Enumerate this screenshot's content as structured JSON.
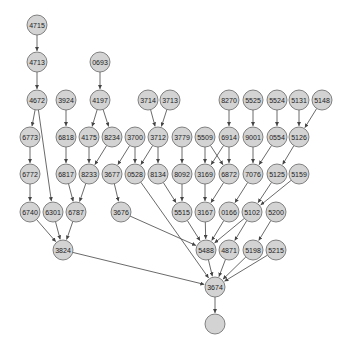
{
  "diagram": {
    "type": "directed-graph",
    "node_radius": 10,
    "node_fill": "#d3d3d3",
    "node_stroke": "#666666",
    "edge_color": "#444444",
    "nodes": [
      {
        "id": "4715",
        "label": "4715",
        "x": 37,
        "y": 25
      },
      {
        "id": "4713",
        "label": "4713",
        "x": 37,
        "y": 62
      },
      {
        "id": "0693",
        "label": "0693",
        "x": 100,
        "y": 62
      },
      {
        "id": "4672",
        "label": "4672",
        "x": 37,
        "y": 100
      },
      {
        "id": "3924",
        "label": "3924",
        "x": 66,
        "y": 100
      },
      {
        "id": "4197",
        "label": "4197",
        "x": 100,
        "y": 100
      },
      {
        "id": "3714",
        "label": "3714",
        "x": 148,
        "y": 100
      },
      {
        "id": "3713",
        "label": "3713",
        "x": 170,
        "y": 100
      },
      {
        "id": "8270",
        "label": "8270",
        "x": 229,
        "y": 100
      },
      {
        "id": "5525",
        "label": "5525",
        "x": 253,
        "y": 100
      },
      {
        "id": "5524",
        "label": "5524",
        "x": 277,
        "y": 100
      },
      {
        "id": "5131",
        "label": "5131",
        "x": 299,
        "y": 100
      },
      {
        "id": "5148",
        "label": "5148",
        "x": 322,
        "y": 100
      },
      {
        "id": "6773",
        "label": "6773",
        "x": 30,
        "y": 137
      },
      {
        "id": "6818",
        "label": "6818",
        "x": 66,
        "y": 137
      },
      {
        "id": "4175",
        "label": "4175",
        "x": 89,
        "y": 137
      },
      {
        "id": "8234",
        "label": "8234",
        "x": 112,
        "y": 137
      },
      {
        "id": "3700",
        "label": "3700",
        "x": 135,
        "y": 137
      },
      {
        "id": "3712",
        "label": "3712",
        "x": 158,
        "y": 137
      },
      {
        "id": "3779",
        "label": "3779",
        "x": 182,
        "y": 137
      },
      {
        "id": "5509",
        "label": "5509",
        "x": 205,
        "y": 137
      },
      {
        "id": "6914",
        "label": "6914",
        "x": 229,
        "y": 137
      },
      {
        "id": "9001",
        "label": "9001",
        "x": 253,
        "y": 137
      },
      {
        "id": "0554",
        "label": "0554",
        "x": 277,
        "y": 137
      },
      {
        "id": "5126",
        "label": "5126",
        "x": 299,
        "y": 137
      },
      {
        "id": "6772",
        "label": "6772",
        "x": 30,
        "y": 174
      },
      {
        "id": "6817",
        "label": "6817",
        "x": 66,
        "y": 174
      },
      {
        "id": "8233",
        "label": "8233",
        "x": 89,
        "y": 174
      },
      {
        "id": "3677",
        "label": "3677",
        "x": 112,
        "y": 174
      },
      {
        "id": "0528",
        "label": "0528",
        "x": 135,
        "y": 174
      },
      {
        "id": "8134",
        "label": "8134",
        "x": 158,
        "y": 174
      },
      {
        "id": "8092",
        "label": "8092",
        "x": 182,
        "y": 174
      },
      {
        "id": "3169",
        "label": "3169",
        "x": 205,
        "y": 174
      },
      {
        "id": "6872",
        "label": "6872",
        "x": 229,
        "y": 174
      },
      {
        "id": "7076",
        "label": "7076",
        "x": 253,
        "y": 174
      },
      {
        "id": "5125",
        "label": "5125",
        "x": 277,
        "y": 174
      },
      {
        "id": "5159",
        "label": "5159",
        "x": 299,
        "y": 174
      },
      {
        "id": "6740",
        "label": "6740",
        "x": 30,
        "y": 212
      },
      {
        "id": "6301",
        "label": "6301",
        "x": 53,
        "y": 212
      },
      {
        "id": "6787",
        "label": "6787",
        "x": 76,
        "y": 212
      },
      {
        "id": "3676",
        "label": "3676",
        "x": 121,
        "y": 212
      },
      {
        "id": "5515",
        "label": "5515",
        "x": 182,
        "y": 212
      },
      {
        "id": "3167",
        "label": "3167",
        "x": 205,
        "y": 212
      },
      {
        "id": "0166",
        "label": "0166",
        "x": 229,
        "y": 212
      },
      {
        "id": "5102",
        "label": "5102",
        "x": 252,
        "y": 212
      },
      {
        "id": "5200",
        "label": "5200",
        "x": 276,
        "y": 212
      },
      {
        "id": "3824",
        "label": "3824",
        "x": 63,
        "y": 250
      },
      {
        "id": "5488",
        "label": "5488",
        "x": 206,
        "y": 250
      },
      {
        "id": "4871",
        "label": "4871",
        "x": 229,
        "y": 250
      },
      {
        "id": "5198",
        "label": "5198",
        "x": 253,
        "y": 250
      },
      {
        "id": "5215",
        "label": "5215",
        "x": 276,
        "y": 250
      },
      {
        "id": "3674",
        "label": "3674",
        "x": 215,
        "y": 287
      },
      {
        "id": "root",
        "label": "",
        "x": 215,
        "y": 324
      }
    ],
    "edges": [
      [
        "4715",
        "4713"
      ],
      [
        "4713",
        "4672"
      ],
      [
        "0693",
        "4197"
      ],
      [
        "4672",
        "6773"
      ],
      [
        "4672",
        "6301"
      ],
      [
        "3924",
        "6818"
      ],
      [
        "4197",
        "4175"
      ],
      [
        "4197",
        "8234"
      ],
      [
        "3714",
        "3712"
      ],
      [
        "3713",
        "3712"
      ],
      [
        "8270",
        "6914"
      ],
      [
        "5525",
        "9001"
      ],
      [
        "5524",
        "0554"
      ],
      [
        "5131",
        "5126"
      ],
      [
        "5148",
        "5126"
      ],
      [
        "6773",
        "6772"
      ],
      [
        "6818",
        "6817"
      ],
      [
        "4175",
        "8233"
      ],
      [
        "8234",
        "8233"
      ],
      [
        "3700",
        "3677"
      ],
      [
        "3700",
        "0528"
      ],
      [
        "3712",
        "0528"
      ],
      [
        "3712",
        "8134"
      ],
      [
        "3779",
        "8092"
      ],
      [
        "5509",
        "3169"
      ],
      [
        "5509",
        "6872"
      ],
      [
        "6914",
        "3169"
      ],
      [
        "6914",
        "6872"
      ],
      [
        "9001",
        "7076"
      ],
      [
        "0554",
        "7076"
      ],
      [
        "5126",
        "5125"
      ],
      [
        "6772",
        "6740"
      ],
      [
        "6817",
        "6787"
      ],
      [
        "8233",
        "6787"
      ],
      [
        "3677",
        "3676"
      ],
      [
        "8134",
        "5515"
      ],
      [
        "8092",
        "5515"
      ],
      [
        "3169",
        "3167"
      ],
      [
        "6872",
        "3167"
      ],
      [
        "7076",
        "0166"
      ],
      [
        "5125",
        "5102"
      ],
      [
        "5159",
        "5102"
      ],
      [
        "6740",
        "3824"
      ],
      [
        "6301",
        "3824"
      ],
      [
        "6787",
        "3824"
      ],
      [
        "3676",
        "5488"
      ],
      [
        "5515",
        "5488"
      ],
      [
        "3167",
        "5488"
      ],
      [
        "0166",
        "5488"
      ],
      [
        "5102",
        "5488"
      ],
      [
        "5102",
        "4871"
      ],
      [
        "5200",
        "5198"
      ],
      [
        "0528",
        "3674"
      ],
      [
        "3824",
        "3674"
      ],
      [
        "5488",
        "3674"
      ],
      [
        "4871",
        "3674"
      ],
      [
        "5198",
        "3674"
      ],
      [
        "5215",
        "3674"
      ],
      [
        "3674",
        "root"
      ]
    ]
  }
}
